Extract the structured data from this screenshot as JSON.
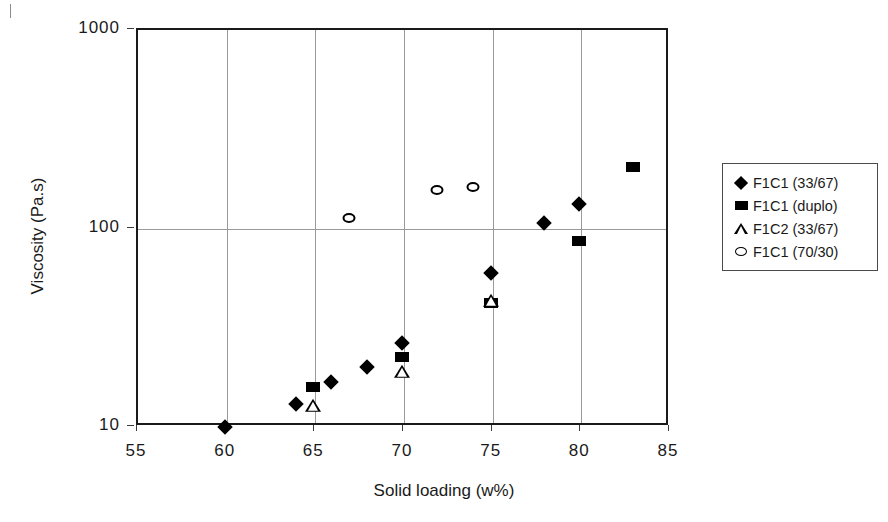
{
  "chart_data": {
    "type": "scatter",
    "title": "",
    "xlabel": "Solid loading (w%)",
    "ylabel": "Viscosity (Pa.s)",
    "xlim": [
      55,
      85
    ],
    "ylim": [
      10,
      1000
    ],
    "yscale": "log",
    "xticks": [
      "55",
      "60",
      "65",
      "70",
      "75",
      "80",
      "85"
    ],
    "yticks": [
      "10",
      "100",
      "1000"
    ],
    "grid": "both",
    "legend_position": "right",
    "series": [
      {
        "name": "F1C1 (33/67)",
        "marker": "filled-diamond",
        "color": "#000000",
        "points": [
          {
            "x": 60,
            "y": 9.8
          },
          {
            "x": 64,
            "y": 12.8
          },
          {
            "x": 66,
            "y": 16.5
          },
          {
            "x": 68,
            "y": 19.5
          },
          {
            "x": 70,
            "y": 26
          },
          {
            "x": 75,
            "y": 58
          },
          {
            "x": 78,
            "y": 104
          },
          {
            "x": 80,
            "y": 130
          }
        ]
      },
      {
        "name": "F1C1 (duplo)",
        "marker": "filled-square",
        "color": "#000000",
        "points": [
          {
            "x": 65,
            "y": 15.5
          },
          {
            "x": 70,
            "y": 22
          },
          {
            "x": 75,
            "y": 41
          },
          {
            "x": 80,
            "y": 85
          },
          {
            "x": 83,
            "y": 200
          }
        ]
      },
      {
        "name": "F1C2 (33/67)",
        "marker": "open-triangle",
        "color": "#000000",
        "points": [
          {
            "x": 65,
            "y": 12.8
          },
          {
            "x": 70,
            "y": 19
          },
          {
            "x": 75,
            "y": 43
          }
        ]
      },
      {
        "name": "F1C1 (70/30)",
        "marker": "open-circle",
        "color": "#000000",
        "points": [
          {
            "x": 67,
            "y": 110
          },
          {
            "x": 72,
            "y": 152
          },
          {
            "x": 74,
            "y": 158
          }
        ]
      }
    ]
  },
  "legend": {
    "items": [
      {
        "label": "F1C1 (33/67)",
        "marker": "filled-diamond"
      },
      {
        "label": "F1C1 (duplo)",
        "marker": "filled-square"
      },
      {
        "label": "F1C2 (33/67)",
        "marker": "open-triangle"
      },
      {
        "label": "F1C1 (70/30)",
        "marker": "open-circle"
      }
    ]
  }
}
